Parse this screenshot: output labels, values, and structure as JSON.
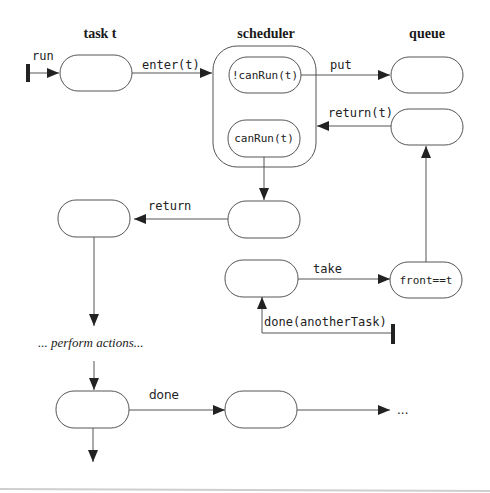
{
  "headers": {
    "task": "task t",
    "scheduler": "scheduler",
    "queue": "queue"
  },
  "states": {
    "not_can_run": "!canRun(t)",
    "can_run": "canRun(t)",
    "front_eq_t": "front==t"
  },
  "transitions": {
    "run": "run",
    "enter": "enter(t)",
    "put": "put",
    "return_t": "return(t)",
    "return": "return",
    "take": "take",
    "done_another": "done(anotherTask)",
    "done": "done"
  },
  "annotations": {
    "perform_actions": "... perform actions...",
    "ellipsis": "..."
  },
  "colors": {
    "stroke": "#555555",
    "text": "#222222",
    "background": "#ffffff"
  }
}
